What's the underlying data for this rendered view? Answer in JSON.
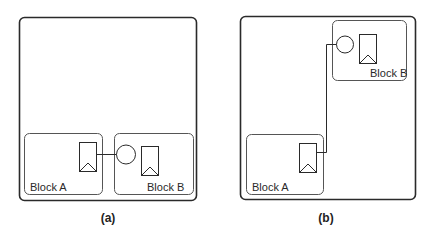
{
  "figure": {
    "panels": [
      {
        "caption": "(a)",
        "blocks": [
          {
            "label": "Block A"
          },
          {
            "label": "Block B"
          }
        ]
      },
      {
        "caption": "(b)",
        "blocks": [
          {
            "label": "Block A"
          },
          {
            "label": "Block B"
          }
        ]
      }
    ]
  },
  "colors": {
    "stroke": "#2a2a2a",
    "block_stroke": "#555555",
    "background": "#ffffff"
  }
}
